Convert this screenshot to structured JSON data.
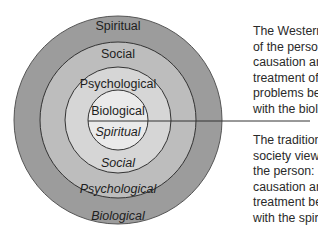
{
  "diagram": {
    "type": "concentric-circles",
    "colors": {
      "outer_ring": "#9c9c9c",
      "second_ring": "#bdbdbd",
      "third_ring": "#d6d6d6",
      "inner_circle": "#eaeaea",
      "stroke": "#333333"
    },
    "rings_top_half_western": [
      {
        "label": "Spiritual",
        "ring": "outer"
      },
      {
        "label": "Social",
        "ring": "second"
      },
      {
        "label": "Psychological",
        "ring": "third"
      },
      {
        "label": "Biological",
        "ring": "inner"
      }
    ],
    "rings_bottom_half_traditional": [
      {
        "label": "Spiritual",
        "ring": "inner"
      },
      {
        "label": "Social",
        "ring": "third"
      },
      {
        "label": "Psychological",
        "ring": "second"
      },
      {
        "label": "Biological",
        "ring": "outer"
      }
    ],
    "western_view": {
      "lines": [
        "The Western view",
        "of the person:",
        "causation and",
        "treatment of",
        "problems begins",
        "with the biological"
      ]
    },
    "traditional_view": {
      "lines": [
        "The traditional",
        "society view of",
        "the person:",
        "causation and",
        "treatment begins",
        "with the spiritual"
      ]
    }
  }
}
